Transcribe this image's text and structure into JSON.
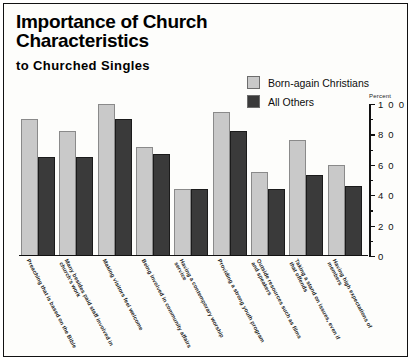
{
  "chart_data": {
    "type": "bar",
    "title": "Importance of Church Characteristics",
    "subtitle": "to Churched Singles",
    "xlabel": "",
    "ylabel": "Percent",
    "ylim": [
      0,
      100
    ],
    "ytick_labels": [
      "0",
      "2 0",
      "4 0",
      "6 0",
      "8 0",
      "1 0 0"
    ],
    "ytick_values": [
      0,
      20,
      40,
      60,
      80,
      100
    ],
    "minor_tick_values": [
      10,
      30,
      50,
      70,
      90
    ],
    "grid": false,
    "legend_position": "top-right",
    "categories": [
      "Preaching that is based on the Bible",
      "Many besides paid staff involved in church's work",
      "Making visitors feel welcome",
      "Being involved in community affairs",
      "Having a contemporary worship service",
      "Providing a strong youth program",
      "Outside resources such as films and speakers",
      "Taking a stand on issues, even if that offends",
      "Having high expectations of members"
    ],
    "series": [
      {
        "name": "Born-again Christians",
        "color": "#c9c9c9",
        "values": [
          90,
          82,
          100,
          72,
          44,
          95,
          55,
          76,
          60
        ]
      },
      {
        "name": "All Others",
        "color": "#3a3a3a",
        "values": [
          65,
          65,
          90,
          67,
          44,
          82,
          44,
          53,
          46
        ]
      }
    ]
  },
  "legend": {
    "items": [
      {
        "label": "Born-again Christians",
        "color": "#c9c9c9"
      },
      {
        "label": "All Others",
        "color": "#3a3a3a"
      }
    ]
  },
  "axis": {
    "percent_caption": "Percent"
  }
}
